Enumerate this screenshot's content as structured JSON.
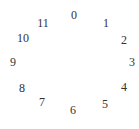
{
  "dial": {
    "numbers": [
      {
        "label": "0",
        "x": 74,
        "y": 15
      },
      {
        "label": "1",
        "x": 106,
        "y": 23
      },
      {
        "label": "2",
        "x": 124,
        "y": 40
      },
      {
        "label": "3",
        "x": 132,
        "y": 62
      },
      {
        "label": "4",
        "x": 124,
        "y": 87
      },
      {
        "label": "5",
        "x": 105,
        "y": 104
      },
      {
        "label": "6",
        "x": 73,
        "y": 110
      },
      {
        "label": "7",
        "x": 42,
        "y": 102
      },
      {
        "label": "8",
        "x": 22,
        "y": 88
      },
      {
        "label": "9",
        "x": 13,
        "y": 62
      },
      {
        "label": "10",
        "x": 23,
        "y": 38
      },
      {
        "label": "11",
        "x": 43,
        "y": 23
      }
    ],
    "text_color": "#333333",
    "background": "#ffffff"
  }
}
